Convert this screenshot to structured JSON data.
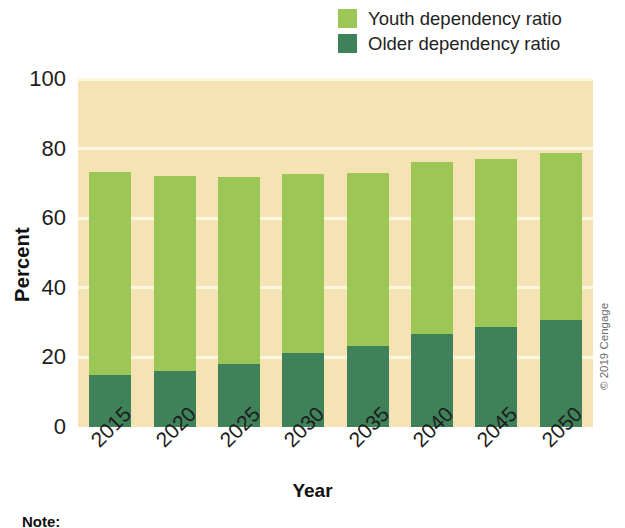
{
  "chart_data": {
    "type": "bar",
    "subtype": "stacked-bar",
    "title": "",
    "xlabel": "Year",
    "ylabel": "Percent",
    "ylim": [
      0,
      100
    ],
    "yticks": [
      0,
      20,
      40,
      60,
      80,
      100
    ],
    "ytick_labels": [
      "0",
      "20",
      "40",
      "60",
      "80",
      "100"
    ],
    "grid": true,
    "grid_axis": "y",
    "legend_position": "top-right",
    "categories": [
      "2015",
      "2020",
      "2025",
      "2030",
      "2035",
      "2040",
      "2045",
      "2050"
    ],
    "series": [
      {
        "name": "Older dependency ratio",
        "color": "#3f8159",
        "values": [
          15.0,
          16.2,
          18.1,
          21.2,
          23.4,
          26.7,
          28.7,
          30.7
        ]
      },
      {
        "name": "Youth dependency ratio",
        "color": "#9cc656",
        "values": [
          58.3,
          56.0,
          53.7,
          51.5,
          49.6,
          49.4,
          48.3,
          48.0
        ]
      }
    ],
    "totals": [
      73.3,
      72.2,
      71.8,
      72.7,
      73.0,
      76.1,
      77.0,
      78.7
    ],
    "stack_order": [
      "Older dependency ratio",
      "Youth dependency ratio"
    ]
  },
  "legend": {
    "items": [
      {
        "label": "Youth dependency ratio",
        "color": "#9cc656"
      },
      {
        "label": "Older dependency ratio",
        "color": "#3f8159"
      }
    ]
  },
  "axes": {
    "y_title": "Percent",
    "x_title": "Year"
  },
  "credit": "© 2019 Cengage",
  "note_label": "Note:",
  "colors": {
    "plot_background": "#f6e3b4",
    "gridline": "#fdf6e1",
    "youth": "#9cc656",
    "older": "#3f8159",
    "page_background": "#ffffff"
  }
}
